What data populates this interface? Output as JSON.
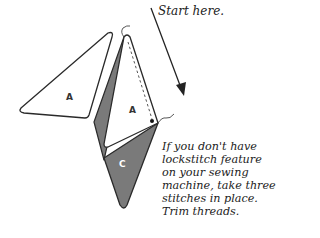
{
  "diagram": {
    "pieces": [
      {
        "id": "left-piece",
        "label": "A",
        "fill": "#ffffff"
      },
      {
        "id": "center-piece",
        "label": "A",
        "fill": "#ffffff"
      },
      {
        "id": "bottom-piece",
        "label": "C",
        "fill": "#7a7a7a"
      }
    ],
    "colors": {
      "outline": "#2a2a2a",
      "dark_fabric": "#7a7a7a",
      "light_fabric": "#ffffff"
    }
  },
  "callouts": {
    "start": "Start here.",
    "instruction_lines": [
      "If you don't have",
      "lockstitch feature",
      "on your sewing",
      "machine, take three",
      "stitches in place.",
      "Trim threads."
    ]
  }
}
